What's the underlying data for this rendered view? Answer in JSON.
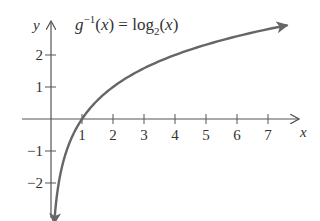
{
  "chart_data": {
    "type": "line",
    "title_parts": {
      "func": "g",
      "sup": "−1",
      "arg": "(x) = log",
      "sub": "2",
      "tail": "(x)"
    },
    "xlabel": "x",
    "ylabel": "y",
    "x_ticks": [
      1,
      2,
      3,
      4,
      5,
      6,
      7
    ],
    "y_ticks": [
      2,
      1,
      -1,
      -2
    ],
    "x_tick_labels": [
      "1",
      "2",
      "3",
      "4",
      "5",
      "6",
      "7"
    ],
    "y_tick_labels": [
      "2",
      "1",
      "−1",
      "−2"
    ],
    "xlim": [
      0,
      8
    ],
    "ylim": [
      -3,
      3
    ],
    "grid": false,
    "series": [
      {
        "name": "log2(x)",
        "color": "#666666",
        "x": [
          0.125,
          0.25,
          0.5,
          1,
          2,
          3,
          4,
          5,
          6,
          7,
          7.6
        ],
        "y": [
          -3,
          -2,
          -1,
          0,
          1,
          1.58,
          2,
          2.32,
          2.58,
          2.81,
          2.93
        ]
      }
    ],
    "annotations": [
      "x-intercept at (1, 0)"
    ]
  }
}
